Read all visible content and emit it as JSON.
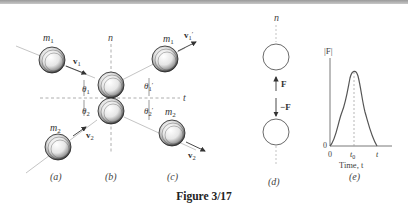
{
  "figure": {
    "caption": "Figure 3/17"
  },
  "panel_a": {
    "label": "(a)",
    "mass_1": "m",
    "mass_1_sub": "1",
    "vel_1": "v",
    "vel_1_sub": "1",
    "mass_2": "m",
    "mass_2_sub": "2",
    "vel_2": "v",
    "vel_2_sub": "2"
  },
  "panel_b": {
    "label": "(b)",
    "normal_axis": "n",
    "tangent_axis": "t",
    "theta_1": "θ",
    "theta_1_sub": "1",
    "theta_2": "θ",
    "theta_2_sub": "2"
  },
  "panel_c": {
    "label": "(c)",
    "mass_1": "m",
    "mass_1_sub": "1",
    "vel_1": "v",
    "vel_1_sub": "1",
    "vel_1_prime": "′",
    "mass_2": "m",
    "mass_2_sub": "2",
    "vel_2": "v",
    "vel_2_sub": "2",
    "theta_1": "θ",
    "theta_1_sub": "1",
    "theta_1_prime": "′",
    "theta_2": "θ",
    "theta_2_sub": "2",
    "theta_2_prime": "′"
  },
  "panel_d": {
    "label": "(d)",
    "normal_axis": "n",
    "force_up": "F",
    "force_down": "−F"
  },
  "panel_e": {
    "label": "(e)",
    "y_axis_label": "|F|",
    "x_axis_label": "Time, t",
    "origin": "0",
    "tick_t0": "t",
    "tick_t0_sub": "0",
    "tick_t": "t",
    "y_origin": "0"
  }
}
